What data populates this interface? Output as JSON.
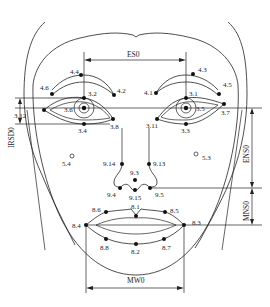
{
  "figure": {
    "dimensions": {
      "ES0": "ES0",
      "IRISD0": "IRSD0",
      "ENS0": "ENS0",
      "MNS0": "MNS0",
      "MW0": "MW0"
    },
    "points": {
      "eyebrow_left": [
        "4.6",
        "4.4",
        "4.2"
      ],
      "eyebrow_right": [
        "4.1",
        "4.3",
        "4.5"
      ],
      "eye_left": [
        "3.12",
        "3.6",
        "3.2",
        "3.4",
        "3.8"
      ],
      "eye_right": [
        "3.11",
        "3.1",
        "3.5",
        "3.3",
        "3.7"
      ],
      "cheeks": [
        "5.4",
        "5.3"
      ],
      "nose": [
        "9.14",
        "9.13",
        "9.3",
        "9.4",
        "9.15",
        "9.5"
      ],
      "mouth": [
        "8.6",
        "8.1",
        "8.5",
        "8.4",
        "8.3",
        "8.8",
        "8.2",
        "8.7"
      ]
    },
    "labels": {
      "p4_4": "4.4",
      "p4_6": "4.6",
      "p4_2": "4.2",
      "p4_3": "4.3",
      "p4_1": "4.1",
      "p4_5": "4.5",
      "p3_2": "3.2",
      "p3_6": "3.6",
      "p3_12": "3.12",
      "p3_4": "3.4",
      "p3_8": "3.8",
      "p3_1": "3.1",
      "p3_5": "3.5",
      "p3_11": "3.11",
      "p3_3": "3.3",
      "p3_7": "3.7",
      "p5_4": "5.4",
      "p5_3": "5.3",
      "p9_14": "9.14",
      "p9_13": "9.13",
      "p9_3": "9.3",
      "p9_4": "9.4",
      "p9_15": "9.15",
      "p9_5": "9.5",
      "p8_6": "8.6",
      "p8_1": "8.1",
      "p8_5": "8.5",
      "p8_4": "8.4",
      "p8_3": "8.3",
      "p8_8": "8.8",
      "p8_2": "8.2",
      "p8_7": "8.7"
    }
  }
}
